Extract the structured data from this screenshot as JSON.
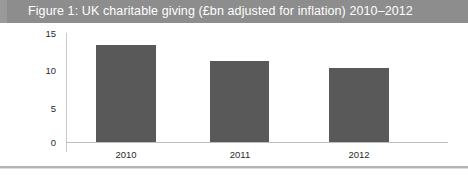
{
  "figure": {
    "title": "Figure 1: UK charitable giving (£bn adjusted for inflation) 2010–2012"
  },
  "chart_data": {
    "type": "bar",
    "title": "Figure 1: UK charitable giving (£bn adjusted for inflation) 2010–2012",
    "categories": [
      "2010",
      "2011",
      "2012"
    ],
    "values": [
      13.3,
      11.2,
      10.2
    ],
    "xlabel": "",
    "ylabel": "",
    "ylim": [
      0,
      15
    ],
    "yticks": [
      "0",
      "5",
      "10",
      "15"
    ],
    "ytick_values": [
      0,
      5,
      10,
      15
    ],
    "grid": false,
    "legend": null,
    "series_color": "#595959",
    "banner_color": "#8d8d8d",
    "banner_text_color": "#ffffff",
    "axis_color": "#c9c9c9",
    "tick_label_color": "#2b2b2b",
    "background": "#ffffff"
  }
}
